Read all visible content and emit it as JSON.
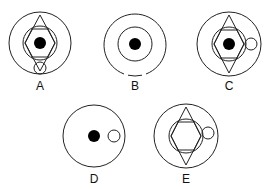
{
  "figure": {
    "stroke_color": "#222222",
    "fill_dot_color": "#000000",
    "options": [
      {
        "label": "A",
        "elements": [
          "outer-circle",
          "inner-circle",
          "diamond",
          "hexagon",
          "black-dot",
          "small-circle-bottom"
        ]
      },
      {
        "label": "B",
        "elements": [
          "outer-circle-broken-bottom",
          "inner-circle",
          "black-dot"
        ]
      },
      {
        "label": "C",
        "elements": [
          "outer-circle",
          "inner-circle",
          "diamond",
          "hexagon",
          "black-dot",
          "small-circle-right"
        ]
      },
      {
        "label": "D",
        "elements": [
          "outer-circle",
          "black-dot",
          "small-circle-right"
        ]
      },
      {
        "label": "E",
        "elements": [
          "outer-circle",
          "inner-circle",
          "diamond",
          "hexagon",
          "small-circle-right"
        ]
      }
    ]
  }
}
